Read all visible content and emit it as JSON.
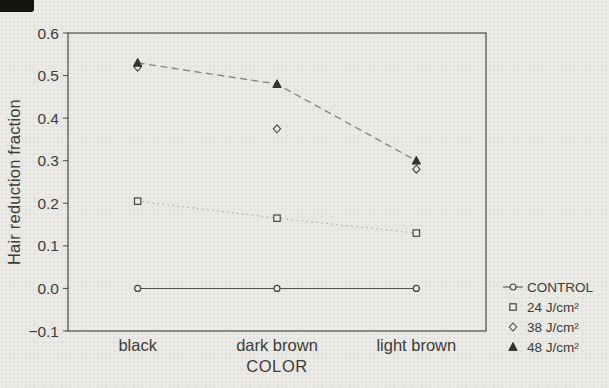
{
  "figure": {
    "paper_color": "#ECEAE6",
    "ink_color": "#3C3C38",
    "frame_color": "#4A4A46",
    "marker_stroke_color": "#46443F",
    "solid_line_color": "#54524E",
    "dashed_line_color": "#85847E",
    "dotted_line_color": "#AAA9A1",
    "triangle_fill_color": "#35332F"
  },
  "chart_data": {
    "type": "line",
    "title": "",
    "xlabel": "COLOR",
    "ylabel": "Hair reduction fraction",
    "categories": [
      "black",
      "dark brown",
      "light brown"
    ],
    "ylim": [
      -0.1,
      0.6
    ],
    "yticks": [
      0.6,
      0.5,
      0.4,
      0.3,
      0.2,
      0.1,
      0.0,
      -0.1
    ],
    "grid": false,
    "legend_position": "right-outside",
    "series": [
      {
        "name": "CONTROL",
        "marker": "circle",
        "line_style": "solid",
        "values": [
          0.0,
          0.0,
          0.0
        ]
      },
      {
        "name": "24 J/cm²",
        "marker": "square",
        "line_style": "dotted",
        "values": [
          0.205,
          0.165,
          0.13
        ]
      },
      {
        "name": "38 J/cm²",
        "marker": "diamond",
        "line_style": "none",
        "values": [
          0.52,
          0.375,
          0.28
        ]
      },
      {
        "name": "48 J/cm²",
        "marker": "triangle-filled",
        "line_style": "dashed",
        "values": [
          0.53,
          0.48,
          0.3
        ]
      }
    ]
  }
}
